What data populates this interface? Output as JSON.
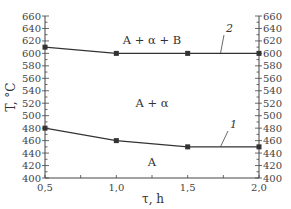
{
  "chart_data": {
    "type": "line",
    "title": "",
    "xlabel": "τ, h",
    "ylabel": "T, °C",
    "xlim": [
      0.5,
      2.0
    ],
    "ylim": [
      400,
      660
    ],
    "x_ticks": [
      "0,5",
      "1,0",
      "1,5",
      "2,0"
    ],
    "y_ticks": [
      400,
      420,
      440,
      460,
      480,
      500,
      520,
      540,
      560,
      580,
      600,
      620,
      640,
      660
    ],
    "y_axis_mirrored_right": true,
    "grid": false,
    "legend": null,
    "x": [
      0.5,
      1.0,
      1.5,
      2.0
    ],
    "series": [
      {
        "name": "1",
        "values": [
          480,
          460,
          450,
          450
        ]
      },
      {
        "name": "2",
        "values": [
          610,
          600,
          600,
          600
        ]
      }
    ],
    "annotations": [
      {
        "text": "A + α + B",
        "x": 1.25,
        "y": 630
      },
      {
        "text": "A + α",
        "x": 1.25,
        "y": 525
      },
      {
        "text": "A",
        "x": 1.25,
        "y": 425
      },
      {
        "text": "2",
        "x": 1.78,
        "y": 640,
        "points_to_series": "2"
      },
      {
        "text": "1",
        "x": 1.78,
        "y": 490,
        "points_to_series": "1"
      }
    ]
  },
  "labels": {
    "xlabel": "τ, h",
    "ylabel": "T, °C",
    "region_top": "A + α + B",
    "region_mid": "A + α",
    "region_bottom": "A",
    "curve1": "1",
    "curve2": "2"
  }
}
